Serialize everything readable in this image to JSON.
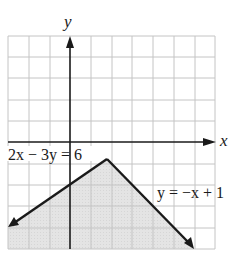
{
  "graph": {
    "axes": {
      "x_label": "x",
      "y_label": "y",
      "x_range": [
        -3,
        7
      ],
      "y_range": [
        -5,
        5
      ]
    },
    "grid": {
      "cols": 10,
      "rows": 10,
      "color": "#c8c8c8"
    },
    "lines": [
      {
        "equation": "2x − 3y = 6",
        "label": "2x − 3y = 6",
        "from": [
          -3,
          -4
        ],
        "to": [
          1.8,
          -0.8
        ]
      },
      {
        "equation": "y = −x + 1",
        "label": "y = −x + 1",
        "from": [
          1.8,
          -0.8
        ],
        "to": [
          5.9,
          -4.9
        ]
      }
    ],
    "vertex": [
      1.8,
      -0.8
    ],
    "shaded_region": "below both lines",
    "shade_color": "#e2e2e2",
    "line_color": "#1a1a1a"
  },
  "labels": {
    "y_axis": "y",
    "x_axis": "x",
    "line1": "2x − 3y = 6",
    "line2": "y = −x + 1"
  }
}
